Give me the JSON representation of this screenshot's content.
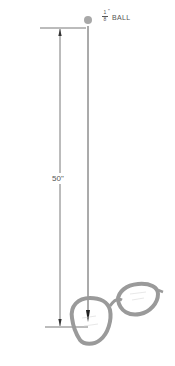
{
  "diagram": {
    "ball": {
      "label": "BALL",
      "size_numerator": "1",
      "size_denominator": "8",
      "size_unit": "\"",
      "color": "#a8a8a8"
    },
    "drop_height": {
      "label": "50\"",
      "value": 50,
      "unit": "in"
    },
    "target": {
      "name": "eyeglasses",
      "frame_color": "#9a9a9a"
    },
    "line_color": "#444444"
  }
}
